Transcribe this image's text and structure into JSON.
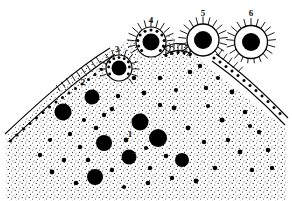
{
  "figure": {
    "background_color": "#ffffff",
    "ink_color": "#000000",
    "width": 292,
    "height": 201
  },
  "labels": [
    {
      "id": "1",
      "text": "1",
      "x": 130,
      "y": 135,
      "meaning": "cytoplasmic nucleocapsid"
    },
    {
      "id": "2",
      "text": "2",
      "x": 83,
      "y": 83,
      "meaning": "nucleocapsid associating with membrane"
    },
    {
      "id": "3",
      "text": "3",
      "x": 117,
      "y": 50,
      "meaning": "early bud formation"
    },
    {
      "id": "4",
      "text": "4",
      "x": 151,
      "y": 21,
      "meaning": "late bud, nearly pinched off"
    },
    {
      "id": "5",
      "text": "5",
      "x": 203,
      "y": 14,
      "meaning": "virion separating from membrane"
    },
    {
      "id": "6",
      "text": "6",
      "x": 251,
      "y": 14,
      "meaning": "free mature enveloped virion"
    }
  ],
  "cell": {
    "name": "cell cytoplasm",
    "stipple_density": "dense",
    "membrane": {
      "name": "plasma membrane",
      "style": "double-line with dark intramembrane particles",
      "particle_color": "#000000"
    }
  },
  "nucleocapsids": [
    {
      "cx": 63,
      "cy": 112,
      "r": 8.5
    },
    {
      "cx": 92,
      "cy": 97,
      "r": 7.5
    },
    {
      "cx": 104,
      "cy": 143,
      "r": 8.0
    },
    {
      "cx": 140,
      "cy": 122,
      "r": 8.5
    },
    {
      "cx": 158,
      "cy": 138,
      "r": 9.0
    },
    {
      "cx": 129,
      "cy": 157,
      "r": 7.5
    },
    {
      "cx": 95,
      "cy": 177,
      "r": 8.0
    },
    {
      "cx": 182,
      "cy": 160,
      "r": 7.0
    }
  ],
  "small_granules_count": 46,
  "buds": [
    {
      "stage": "3",
      "cx": 119,
      "cy": 68,
      "core_r": 7.5,
      "envelope_r": 13.0,
      "spikes": 20
    },
    {
      "stage": "4",
      "cx": 151,
      "cy": 42,
      "core_r": 8.5,
      "envelope_r": 15.0,
      "spikes": 24
    }
  ],
  "free_virions": [
    {
      "stage": "5",
      "cx": 203,
      "cy": 40,
      "core_r": 9.0,
      "envelope_r": 16.0,
      "spikes": 26
    },
    {
      "stage": "6",
      "cx": 251,
      "cy": 42,
      "core_r": 9.0,
      "envelope_r": 16.5,
      "spikes": 28
    }
  ],
  "legend_note": "Stages 1 to 6 trace nucleocapsid transport, membrane association, budding and release."
}
